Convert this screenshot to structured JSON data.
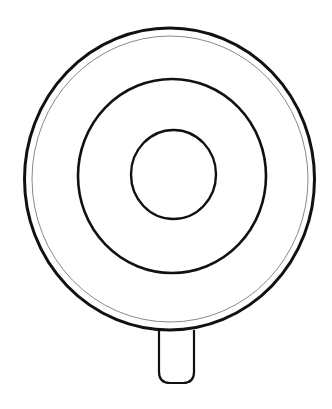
{
  "drawing": {
    "subject": "lollipop / target line drawing",
    "stroke_color": "#111111",
    "thin_stroke_color": "#888888",
    "background": "#ffffff"
  }
}
